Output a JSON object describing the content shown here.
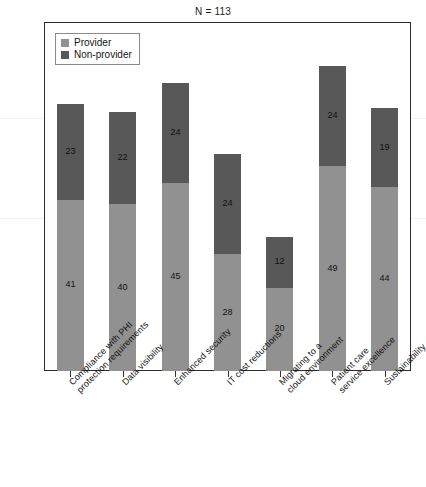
{
  "caption": {
    "sample_size": "N = 113"
  },
  "legend": {
    "position": "top-left-inside",
    "items": [
      {
        "label": "Provider",
        "color": "#919191"
      },
      {
        "label": "Non-provider",
        "color": "#585858"
      }
    ]
  },
  "colors": {
    "provider": "#919191",
    "non_provider": "#585858",
    "frame": "#2b2b2b",
    "text": "#121212",
    "background": "#ffffff"
  },
  "chart_data": {
    "type": "bar",
    "stacked": true,
    "title": "",
    "subtitle": "N = 113",
    "xlabel": "",
    "ylabel": "",
    "grid": false,
    "legend_position": "top-left",
    "ylim": [
      0,
      82
    ],
    "categories": [
      "Compliance with PHI\nprotection requirements",
      "Data visibility",
      "Enhanced security",
      "IT cost reductions",
      "Migrating to a\ncloud environment",
      "Patient care\nservice excellence",
      "Sustainability"
    ],
    "series": [
      {
        "name": "Provider",
        "color": "#919191",
        "values": [
          41,
          40,
          45,
          28,
          20,
          49,
          44
        ]
      },
      {
        "name": "Non-provider",
        "color": "#585858",
        "values": [
          23,
          22,
          24,
          24,
          12,
          24,
          19
        ]
      }
    ],
    "totals": [
      64,
      62,
      69,
      52,
      32,
      73,
      63
    ],
    "data_labels": [
      {
        "category": "Compliance with PHI protection requirements",
        "provider": 41,
        "non_provider": 23
      },
      {
        "category": "Data visibility",
        "provider": 40,
        "non_provider": 22
      },
      {
        "category": "Enhanced security",
        "provider": 45,
        "non_provider": 24
      },
      {
        "category": "IT cost reductions",
        "provider": 28,
        "non_provider": 24
      },
      {
        "category": "Migrating to a cloud environment",
        "provider": 20,
        "non_provider": 12
      },
      {
        "category": "Patient care service excellence",
        "provider": 49,
        "non_provider": 24
      },
      {
        "category": "Sustainability",
        "provider": 44,
        "non_provider": 19
      }
    ]
  }
}
